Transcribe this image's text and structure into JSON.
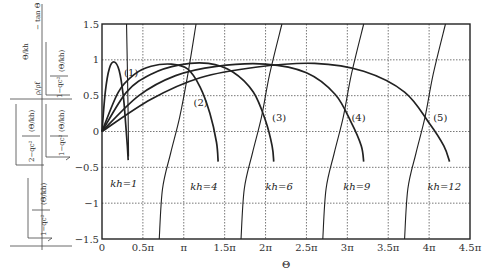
{
  "chart_data": {
    "type": "line",
    "title": "",
    "xlabel": "Θ",
    "ylabel": "ρ/ρf · √(1 − q_c² / (1 + (Θ/kh)²)) / √(2 − q_c² / (1 + (Θ/kh)²)) · Θ/kh  − tan Θ (composite expression)",
    "xlim_pi": [
      0,
      4.5
    ],
    "ylim": [
      -1.5,
      1.5
    ],
    "grid": true,
    "x_ticks": [
      "0",
      "0.5π",
      "π",
      "1.5π",
      "2π",
      "2.5π",
      "3π",
      "3.5π",
      "4π",
      "4.5π"
    ],
    "y_ticks": [
      "1.5",
      "1",
      "0.5",
      "0",
      "−0.5",
      "−1",
      "−1.5"
    ],
    "y_tick_values": [
      1.5,
      1,
      0.5,
      0,
      -0.5,
      -1,
      -1.5
    ],
    "series": [
      {
        "name": "kh=1",
        "kind": "arc",
        "points": [
          [
            0,
            0
          ],
          [
            0.04,
            0.55
          ],
          [
            0.09,
            0.88
          ],
          [
            0.15,
            0.97
          ],
          [
            0.21,
            0.85
          ],
          [
            0.26,
            0.5
          ],
          [
            0.29,
            0.1
          ],
          [
            0.31,
            -0.2
          ],
          [
            0.32,
            -0.4
          ]
        ]
      },
      {
        "name": "kh=4",
        "kind": "arc",
        "points": [
          [
            0,
            0
          ],
          [
            0.2,
            0.55
          ],
          [
            0.4,
            0.8
          ],
          [
            0.6,
            0.91
          ],
          [
            0.85,
            0.94
          ],
          [
            1.05,
            0.87
          ],
          [
            1.2,
            0.62
          ],
          [
            1.32,
            0.25
          ],
          [
            1.4,
            -0.15
          ],
          [
            1.42,
            -0.42
          ]
        ]
      },
      {
        "name": "kh=6",
        "kind": "arc",
        "points": [
          [
            0,
            0
          ],
          [
            0.3,
            0.55
          ],
          [
            0.6,
            0.8
          ],
          [
            0.95,
            0.93
          ],
          [
            1.3,
            0.95
          ],
          [
            1.6,
            0.83
          ],
          [
            1.85,
            0.55
          ],
          [
            2.0,
            0.15
          ],
          [
            2.08,
            -0.2
          ],
          [
            2.1,
            -0.42
          ]
        ]
      },
      {
        "name": "kh=9",
        "kind": "arc",
        "points": [
          [
            0,
            0
          ],
          [
            0.45,
            0.5
          ],
          [
            0.9,
            0.78
          ],
          [
            1.4,
            0.91
          ],
          [
            2.0,
            0.94
          ],
          [
            2.5,
            0.82
          ],
          [
            2.85,
            0.52
          ],
          [
            3.05,
            0.12
          ],
          [
            3.17,
            -0.2
          ],
          [
            3.2,
            -0.42
          ]
        ]
      },
      {
        "name": "kh=12",
        "kind": "arc",
        "points": [
          [
            0,
            0
          ],
          [
            0.6,
            0.45
          ],
          [
            1.2,
            0.75
          ],
          [
            1.9,
            0.9
          ],
          [
            2.6,
            0.95
          ],
          [
            3.2,
            0.84
          ],
          [
            3.7,
            0.55
          ],
          [
            4.0,
            0.12
          ],
          [
            4.18,
            -0.2
          ],
          [
            4.25,
            -0.42
          ]
        ]
      },
      {
        "name": "(1)",
        "kind": "branch",
        "points": [
          [
            0.3,
            1.5
          ],
          [
            0.31,
            0.9
          ],
          [
            0.32,
            0.2
          ],
          [
            0.325,
            -0.35
          ]
        ]
      },
      {
        "name": "(2)",
        "kind": "branch",
        "points": [
          [
            0.7,
            -1.5
          ],
          [
            0.74,
            -0.8
          ],
          [
            0.84,
            -0.3
          ],
          [
            0.95,
            0.2
          ],
          [
            1.05,
            0.8
          ],
          [
            1.15,
            1.5
          ]
        ]
      },
      {
        "name": "(3)",
        "kind": "branch",
        "points": [
          [
            1.7,
            -1.5
          ],
          [
            1.74,
            -0.8
          ],
          [
            1.84,
            -0.3
          ],
          [
            1.95,
            0.2
          ],
          [
            2.05,
            0.8
          ],
          [
            2.2,
            1.5
          ]
        ]
      },
      {
        "name": "(4)",
        "kind": "branch",
        "points": [
          [
            2.7,
            -1.5
          ],
          [
            2.74,
            -0.8
          ],
          [
            2.84,
            -0.3
          ],
          [
            2.95,
            0.2
          ],
          [
            3.05,
            0.8
          ],
          [
            3.2,
            1.5
          ]
        ]
      },
      {
        "name": "(5)",
        "kind": "branch",
        "points": [
          [
            3.7,
            -1.5
          ],
          [
            3.74,
            -0.8
          ],
          [
            3.84,
            -0.3
          ],
          [
            3.95,
            0.2
          ],
          [
            4.05,
            0.8
          ],
          [
            4.2,
            1.5
          ]
        ]
      }
    ],
    "annotations": [
      {
        "text": "(1)",
        "x_pi": 0.27,
        "y": 0.78
      },
      {
        "text": "(2)",
        "x_pi": 1.12,
        "y": 0.35
      },
      {
        "text": "(3)",
        "x_pi": 2.08,
        "y": 0.15
      },
      {
        "text": "(4)",
        "x_pi": 3.05,
        "y": 0.15
      },
      {
        "text": "(5)",
        "x_pi": 4.05,
        "y": 0.15
      },
      {
        "text": "kh=1",
        "x_pi": 0.1,
        "y": -0.78
      },
      {
        "text": "kh=4",
        "x_pi": 1.08,
        "y": -0.82
      },
      {
        "text": "kh=6",
        "x_pi": 2.0,
        "y": -0.82
      },
      {
        "text": "kh=9",
        "x_pi": 2.95,
        "y": -0.82
      },
      {
        "text": "kh=12",
        "x_pi": 3.98,
        "y": -0.82
      }
    ]
  },
  "ylabel_parts": {
    "top": "Θ/kh · ρ/ρf · √(1 − q_c²/(1+(Θ/kh)²)) − tan Θ",
    "bottom": "√(2 − q_c²(1+(Θ/kh)²)) / √(1 − q_c²(1+(Θ/kh)²)) · 4√(1 − q_c²/(1+(Θ/kh)²))"
  },
  "colors": {
    "curve": "#222222",
    "grid": "#555555",
    "frame": "#222222"
  }
}
